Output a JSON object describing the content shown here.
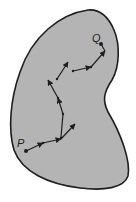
{
  "diagram": {
    "colors": {
      "region_fill": "#b4b4b4",
      "region_stroke": "#1e1e1e",
      "path_stroke": "#1e1e1e",
      "background": "#ffffff"
    },
    "labels": {
      "start": "P",
      "end": "Q"
    },
    "points": {
      "start": [
        26,
        151
      ],
      "end": [
        101,
        44
      ]
    },
    "segments": [
      {
        "from": [
          26,
          151
        ],
        "to": [
          43,
          143
        ]
      },
      {
        "from": [
          43,
          143
        ],
        "to": [
          61,
          139
        ]
      },
      {
        "from": [
          61,
          139
        ],
        "to": [
          75,
          124
        ]
      },
      {
        "from": [
          61,
          135
        ],
        "to": [
          63,
          114
        ]
      },
      {
        "from": [
          63,
          114
        ],
        "to": [
          58,
          98
        ]
      },
      {
        "from": [
          58,
          98
        ],
        "to": [
          48,
          80
        ]
      },
      {
        "from": [
          57,
          78
        ],
        "to": [
          68,
          62
        ]
      },
      {
        "from": [
          73,
          71
        ],
        "to": [
          91,
          67
        ]
      },
      {
        "from": [
          91,
          66
        ],
        "to": [
          105,
          51
        ]
      },
      {
        "from": [
          105,
          51
        ],
        "to": [
          101,
          44
        ]
      }
    ]
  }
}
